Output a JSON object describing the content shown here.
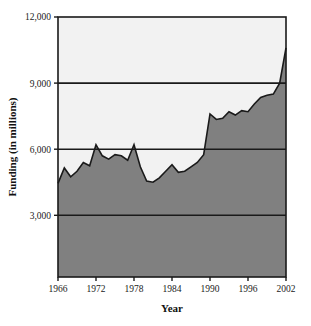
{
  "chart_data": {
    "type": "area",
    "title": "",
    "xlabel": "Year",
    "ylabel": "Funding (in millions)",
    "xlim": [
      1966,
      2002
    ],
    "ylim": [
      200,
      12000
    ],
    "grid": true,
    "legend": "none",
    "fill_color": "#808080",
    "background_color": "#f2f2f2",
    "line_color": "#1a1a1a",
    "axis_color": "#1a1a1a",
    "xticks": [
      1966,
      1972,
      1978,
      1984,
      1990,
      1996,
      2002
    ],
    "xtick_labels": [
      "1966",
      "1972",
      "1978",
      "1984",
      "1990",
      "1996",
      "2002"
    ],
    "yticks": [
      3000,
      6000,
      9000,
      12000
    ],
    "ytick_labels": [
      "3,000",
      "6,000",
      "9,000",
      "12,000"
    ],
    "x": [
      1966,
      1967,
      1968,
      1969,
      1970,
      1971,
      1972,
      1973,
      1974,
      1975,
      1976,
      1977,
      1978,
      1979,
      1980,
      1981,
      1982,
      1983,
      1984,
      1985,
      1986,
      1987,
      1988,
      1989,
      1990,
      1991,
      1992,
      1993,
      1994,
      1995,
      1996,
      1997,
      1998,
      1999,
      2000,
      2001,
      2002
    ],
    "values": [
      4450,
      5150,
      4750,
      5000,
      5400,
      5250,
      6200,
      5700,
      5550,
      5750,
      5700,
      5500,
      6200,
      5200,
      4550,
      4500,
      4700,
      5000,
      5300,
      4950,
      5000,
      5200,
      5400,
      5750,
      7600,
      7350,
      7400,
      7700,
      7550,
      7750,
      7700,
      8050,
      8350,
      8450,
      8500,
      9000,
      10600
    ],
    "series_name": "Funding"
  },
  "axes": {
    "y_label": "Funding (in millions)",
    "x_label": "Year"
  }
}
